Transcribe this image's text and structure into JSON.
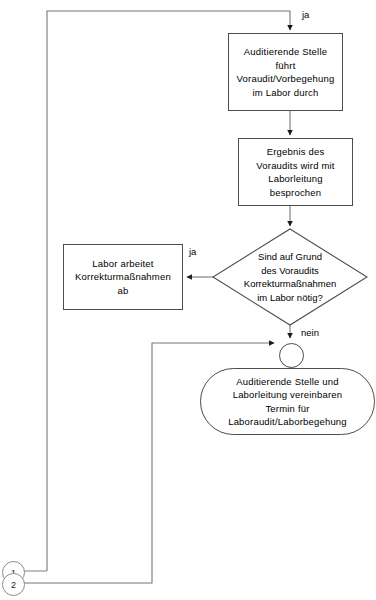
{
  "diagram": {
    "language": "de",
    "stroke_color": "#4d4d4d",
    "connector_color": "#8a8a8a",
    "background": "#ffffff",
    "nodes": [
      {
        "id": "voraudit",
        "type": "process",
        "text": "Auditierende Stelle\nführt\nVoraudit/Vorbegehung\nim Labor durch"
      },
      {
        "id": "ergebnis",
        "type": "process",
        "text": "Ergebnis des\nVoraudits wird mit\nLaborleitung\nbesprochen"
      },
      {
        "id": "entscheidung",
        "type": "decision",
        "text": "Sind auf Grund\ndes Voraudits\nKorrekturmaßnahmen\nim Labor nötig?"
      },
      {
        "id": "korrektur",
        "type": "process",
        "text": "Labor arbeitet\nKorrekturmaßnahmen\nab"
      },
      {
        "id": "termin",
        "type": "terminator",
        "text": "Auditierende Stelle und\nLaborleitung vereinbaren\nTermin für\nLaboraudit/Laborbegehung"
      },
      {
        "id": "junction",
        "type": "junction",
        "text": ""
      }
    ],
    "edge_labels": {
      "top_ja": "ja",
      "decision_ja": "ja",
      "decision_nein": "nein"
    },
    "connectors": [
      {
        "id": "connector-1",
        "label": "1"
      },
      {
        "id": "connector-2",
        "label": "2"
      }
    ]
  }
}
